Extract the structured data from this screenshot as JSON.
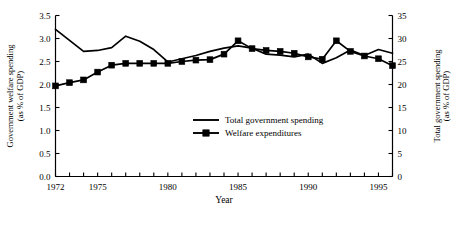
{
  "chart_data": {
    "type": "line",
    "title": "",
    "xlabel": "Year",
    "x": [
      1972,
      1973,
      1974,
      1975,
      1976,
      1977,
      1978,
      1979,
      1980,
      1981,
      1982,
      1983,
      1984,
      1985,
      1986,
      1987,
      1988,
      1989,
      1990,
      1991,
      1992,
      1993,
      1994,
      1995,
      1996
    ],
    "xlim": [
      1972,
      1996
    ],
    "xtick_labels": [
      "1972",
      "1975",
      "1980",
      "1985",
      "1990",
      "1995"
    ],
    "xtick_values": [
      1972,
      1975,
      1980,
      1985,
      1990,
      1995
    ],
    "grid": false,
    "legend_position": "center",
    "left_axis": {
      "label": "Government welfare spending",
      "label_line2": "(as % of GDP)",
      "ylim": [
        0.0,
        3.5
      ],
      "ticks": [
        0.0,
        0.5,
        1.0,
        1.5,
        2.0,
        2.5,
        3.0,
        3.5
      ],
      "tick_labels": [
        "0.0",
        "0.5",
        "1.0",
        "1.5",
        "2.0",
        "2.5",
        "3.0",
        "3.5"
      ]
    },
    "right_axis": {
      "label": "Total government spending",
      "label_line2": "(as % of GDP)",
      "ylim": [
        0,
        35
      ],
      "ticks": [
        0,
        5,
        10,
        15,
        20,
        25,
        30,
        35
      ],
      "tick_labels": [
        "0",
        "5",
        "10",
        "15",
        "20",
        "25",
        "30",
        "35"
      ]
    },
    "series": [
      {
        "name": "Total government spending",
        "axis": "right",
        "marker": "none",
        "color": "#000000",
        "values": [
          32.0,
          29.6,
          27.2,
          27.4,
          28.0,
          30.5,
          29.4,
          27.6,
          24.9,
          25.6,
          26.3,
          27.2,
          27.9,
          28.4,
          27.9,
          26.6,
          26.4,
          26.0,
          26.6,
          24.6,
          25.8,
          27.5,
          26.3,
          27.6,
          26.8
        ]
      },
      {
        "name": "Welfare expenditures",
        "axis": "left",
        "marker": "square",
        "color": "#000000",
        "values": [
          1.97,
          2.04,
          2.1,
          2.27,
          2.42,
          2.46,
          2.46,
          2.46,
          2.46,
          2.5,
          2.53,
          2.54,
          2.66,
          2.95,
          2.78,
          2.74,
          2.72,
          2.68,
          2.6,
          2.55,
          2.95,
          2.72,
          2.62,
          2.56,
          2.41
        ]
      }
    ],
    "legend": [
      {
        "label": "Total government spending",
        "marker": "line"
      },
      {
        "label": "Welfare expenditures",
        "marker": "line-square"
      }
    ]
  }
}
